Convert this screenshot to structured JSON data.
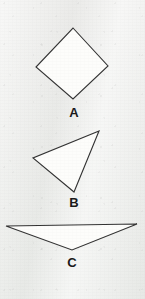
{
  "page": {
    "background_color": "#edeeec",
    "width": 145,
    "height": 299
  },
  "figure": {
    "stroke_color": "#333333",
    "fill_color": "#fdfdfb",
    "stroke_width": 1.1,
    "label_color": "#1a1a1a"
  },
  "shapes": [
    {
      "label": "A",
      "kind": "quadrilateral-diamond",
      "points": "73,28 108,66 73,99 36,67",
      "label_x": 74,
      "label_y": 113
    },
    {
      "label": "B",
      "kind": "triangle-scalene",
      "points": "99,131 74,192 33,158",
      "label_x": 74,
      "label_y": 203
    },
    {
      "label": "C",
      "kind": "triangle-obtuse-wide",
      "points": "6,226 137,224 72,250",
      "label_x": 72,
      "label_y": 263
    }
  ]
}
